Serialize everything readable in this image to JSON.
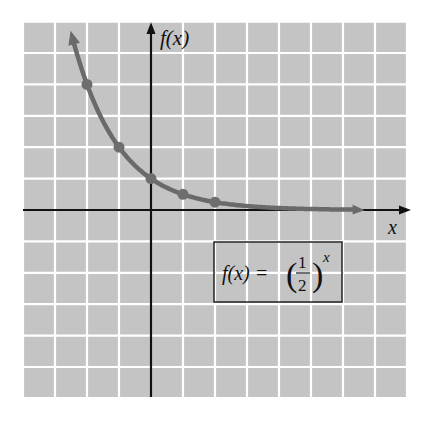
{
  "chart_data": {
    "type": "line",
    "title": "",
    "xlabel": "x",
    "ylabel": "f(x)",
    "function": "f(x) = (1/2)^x",
    "formula_box": {
      "lhs": "f(x) =",
      "numerator": "1",
      "denominator": "2",
      "exponent": "x"
    },
    "xlim": [
      -4,
      8
    ],
    "ylim": [
      -6,
      6
    ],
    "grid": true,
    "grid_spacing": 1,
    "points": [
      {
        "x": -2,
        "y": 4
      },
      {
        "x": -1,
        "y": 2
      },
      {
        "x": 0,
        "y": 1
      },
      {
        "x": 1,
        "y": 0.5
      },
      {
        "x": 2,
        "y": 0.25
      }
    ],
    "curve_extent": {
      "x_min": -2.4,
      "x_max": 6.3
    },
    "colors": {
      "background": "#c4c4c4",
      "grid": "#ffffff",
      "axis": "#111111",
      "curve": "#6a6a6a",
      "point": "#6e6e6e"
    }
  }
}
